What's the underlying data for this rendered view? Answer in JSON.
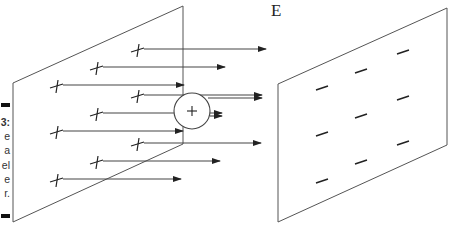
{
  "figure": {
    "field_label": "E",
    "caption_fragments": [
      "3:",
      "e",
      "a",
      "el",
      "e",
      "r."
    ],
    "colors": {
      "line": "#444444",
      "plate": "#555555",
      "text": "#222222",
      "background": "#ffffff"
    },
    "test_charge": {
      "symbol": "+",
      "cx": 192,
      "cy": 111,
      "r": 18
    },
    "left_plate": {
      "charge_symbol": "+",
      "corners": [
        [
          13,
          83
        ],
        [
          183,
          6
        ],
        [
          183,
          144
        ],
        [
          13,
          222
        ]
      ],
      "charges": [
        {
          "x": 138,
          "y": 50,
          "arrow_end": 266
        },
        {
          "x": 97,
          "y": 68,
          "arrow_end": 225
        },
        {
          "x": 57,
          "y": 86,
          "arrow_end": 184
        },
        {
          "x": 138,
          "y": 96,
          "arrow_end": 262
        },
        {
          "x": 97,
          "y": 114,
          "arrow_end": 222
        },
        {
          "x": 57,
          "y": 132,
          "arrow_end": 183
        },
        {
          "x": 138,
          "y": 144,
          "arrow_end": 261
        },
        {
          "x": 97,
          "y": 162,
          "arrow_end": 220
        },
        {
          "x": 57,
          "y": 180,
          "arrow_end": 181
        }
      ]
    },
    "right_plate": {
      "charge_symbol": "−",
      "corners": [
        [
          278,
          84
        ],
        [
          447,
          8
        ],
        [
          447,
          145
        ],
        [
          278,
          222
        ]
      ],
      "charges": [
        {
          "x": 403,
          "y": 52
        },
        {
          "x": 361,
          "y": 71
        },
        {
          "x": 322,
          "y": 88
        },
        {
          "x": 403,
          "y": 98
        },
        {
          "x": 361,
          "y": 116
        },
        {
          "x": 322,
          "y": 134
        },
        {
          "x": 403,
          "y": 143
        },
        {
          "x": 361,
          "y": 162
        },
        {
          "x": 322,
          "y": 181
        }
      ]
    }
  }
}
